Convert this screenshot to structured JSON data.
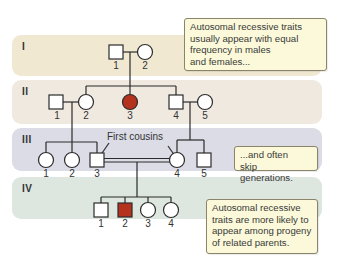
{
  "colors": {
    "band_I": "#f1e8d2",
    "band_II": "#efe9e0",
    "band_III": "#dcdce6",
    "band_IV": "#dde6df",
    "affected": "#b5321f",
    "callout_bg": "#fbf9d9"
  },
  "generations": [
    {
      "label": "I",
      "individuals": [
        {
          "id": "1",
          "sex": "male",
          "affected": false
        },
        {
          "id": "2",
          "sex": "female",
          "affected": false
        }
      ]
    },
    {
      "label": "II",
      "individuals": [
        {
          "id": "1",
          "sex": "male",
          "affected": false
        },
        {
          "id": "2",
          "sex": "female",
          "affected": false
        },
        {
          "id": "3",
          "sex": "female",
          "affected": true
        },
        {
          "id": "4",
          "sex": "male",
          "affected": false
        },
        {
          "id": "5",
          "sex": "female",
          "affected": false
        }
      ]
    },
    {
      "label": "III",
      "individuals": [
        {
          "id": "1",
          "sex": "female",
          "affected": false
        },
        {
          "id": "2",
          "sex": "female",
          "affected": false
        },
        {
          "id": "3",
          "sex": "male",
          "affected": false
        },
        {
          "id": "4",
          "sex": "female",
          "affected": false
        },
        {
          "id": "5",
          "sex": "male",
          "affected": false
        }
      ]
    },
    {
      "label": "IV",
      "individuals": [
        {
          "id": "1",
          "sex": "male",
          "affected": false
        },
        {
          "id": "2",
          "sex": "male",
          "affected": true
        },
        {
          "id": "3",
          "sex": "female",
          "affected": false
        },
        {
          "id": "4",
          "sex": "female",
          "affected": false
        }
      ]
    }
  ],
  "annotation": {
    "first_cousins": "First cousins"
  },
  "callouts": [
    {
      "lines": [
        "Autosomal recessive traits",
        "usually appear with equal",
        "frequency in males",
        "and females..."
      ]
    },
    {
      "lines": [
        "...and often",
        "skip generations."
      ]
    },
    {
      "lines": [
        "Autosomal recessive",
        "traits are more likely to",
        "appear among progeny",
        "of related parents."
      ]
    }
  ]
}
